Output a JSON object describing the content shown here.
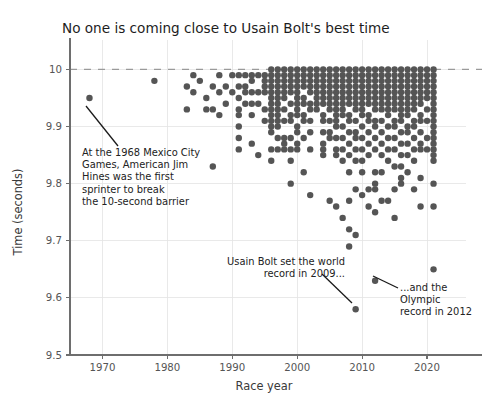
{
  "chart_data": {
    "type": "scatter",
    "title": "No one is coming close to Usain Bolt's best time",
    "xlabel": "Race year",
    "ylabel": "Time (seconds)",
    "xlim": [
      1965,
      2026
    ],
    "ylim": [
      9.5,
      10.02
    ],
    "xticks": [
      1970,
      1980,
      1990,
      2000,
      2010,
      2020
    ],
    "xtick_labels": [
      "1970",
      "1980",
      "1990",
      "2000",
      "2010",
      "2020"
    ],
    "yticks": [
      9.5,
      9.6,
      9.7,
      9.8,
      9.9,
      10.0
    ],
    "ytick_labels": [
      "9.5",
      "9.6",
      "9.7",
      "9.8",
      "9.9",
      "10"
    ],
    "grid": true,
    "legend": "none",
    "reference_line": {
      "y": 10.0,
      "style": "dashed",
      "label": "10-second barrier"
    },
    "marker": {
      "shape": "circle",
      "color": "#555555",
      "size": 4.6
    },
    "points": [
      [
        1968,
        9.95
      ],
      [
        1978,
        9.98
      ],
      [
        1983,
        9.93
      ],
      [
        1983,
        9.97
      ],
      [
        1984,
        9.96
      ],
      [
        1984,
        9.99
      ],
      [
        1985,
        9.98
      ],
      [
        1986,
        9.93
      ],
      [
        1986,
        9.95
      ],
      [
        1987,
        9.83
      ],
      [
        1987,
        9.93
      ],
      [
        1987,
        9.97
      ],
      [
        1988,
        9.92
      ],
      [
        1988,
        9.96
      ],
      [
        1988,
        9.99
      ],
      [
        1989,
        9.94
      ],
      [
        1989,
        9.97
      ],
      [
        1990,
        9.96
      ],
      [
        1990,
        9.99
      ],
      [
        1991,
        9.86
      ],
      [
        1991,
        9.88
      ],
      [
        1991,
        9.9
      ],
      [
        1991,
        9.92
      ],
      [
        1991,
        9.93
      ],
      [
        1991,
        9.95
      ],
      [
        1991,
        9.97
      ],
      [
        1991,
        9.99
      ],
      [
        1992,
        9.94
      ],
      [
        1992,
        9.96
      ],
      [
        1992,
        9.97
      ],
      [
        1992,
        9.99
      ],
      [
        1993,
        9.87
      ],
      [
        1993,
        9.92
      ],
      [
        1993,
        9.94
      ],
      [
        1993,
        9.96
      ],
      [
        1993,
        9.98
      ],
      [
        1993,
        9.99
      ],
      [
        1994,
        9.85
      ],
      [
        1994,
        9.94
      ],
      [
        1994,
        9.96
      ],
      [
        1994,
        9.99
      ],
      [
        1995,
        9.91
      ],
      [
        1995,
        9.93
      ],
      [
        1995,
        9.96
      ],
      [
        1995,
        9.97
      ],
      [
        1995,
        9.98
      ],
      [
        1995,
        9.99
      ],
      [
        1996,
        9.84
      ],
      [
        1996,
        9.86
      ],
      [
        1996,
        9.89
      ],
      [
        1996,
        9.9
      ],
      [
        1996,
        9.91
      ],
      [
        1996,
        9.92
      ],
      [
        1996,
        9.93
      ],
      [
        1996,
        9.94
      ],
      [
        1996,
        9.95
      ],
      [
        1996,
        9.96
      ],
      [
        1996,
        9.97
      ],
      [
        1996,
        9.98
      ],
      [
        1996,
        9.99
      ],
      [
        1996,
        10.0
      ],
      [
        1997,
        9.86
      ],
      [
        1997,
        9.88
      ],
      [
        1997,
        9.9
      ],
      [
        1997,
        9.91
      ],
      [
        1997,
        9.92
      ],
      [
        1997,
        9.93
      ],
      [
        1997,
        9.94
      ],
      [
        1997,
        9.95
      ],
      [
        1997,
        9.96
      ],
      [
        1997,
        9.97
      ],
      [
        1997,
        9.98
      ],
      [
        1997,
        9.99
      ],
      [
        1997,
        10.0
      ],
      [
        1998,
        9.86
      ],
      [
        1998,
        9.87
      ],
      [
        1998,
        9.88
      ],
      [
        1998,
        9.91
      ],
      [
        1998,
        9.93
      ],
      [
        1998,
        9.95
      ],
      [
        1998,
        9.96
      ],
      [
        1998,
        9.97
      ],
      [
        1998,
        9.98
      ],
      [
        1998,
        9.99
      ],
      [
        1998,
        10.0
      ],
      [
        1999,
        9.8
      ],
      [
        1999,
        9.84
      ],
      [
        1999,
        9.86
      ],
      [
        1999,
        9.88
      ],
      [
        1999,
        9.91
      ],
      [
        1999,
        9.92
      ],
      [
        1999,
        9.94
      ],
      [
        1999,
        9.96
      ],
      [
        1999,
        9.97
      ],
      [
        1999,
        9.98
      ],
      [
        1999,
        9.99
      ],
      [
        1999,
        10.0
      ],
      [
        2000,
        9.86
      ],
      [
        2000,
        9.87
      ],
      [
        2000,
        9.89
      ],
      [
        2000,
        9.9
      ],
      [
        2000,
        9.92
      ],
      [
        2000,
        9.93
      ],
      [
        2000,
        9.94
      ],
      [
        2000,
        9.95
      ],
      [
        2000,
        9.96
      ],
      [
        2000,
        9.97
      ],
      [
        2000,
        9.98
      ],
      [
        2000,
        9.99
      ],
      [
        2000,
        10.0
      ],
      [
        2001,
        9.82
      ],
      [
        2001,
        9.88
      ],
      [
        2001,
        9.91
      ],
      [
        2001,
        9.92
      ],
      [
        2001,
        9.94
      ],
      [
        2001,
        9.95
      ],
      [
        2001,
        9.97
      ],
      [
        2001,
        9.98
      ],
      [
        2001,
        9.99
      ],
      [
        2001,
        10.0
      ],
      [
        2002,
        9.78
      ],
      [
        2002,
        9.86
      ],
      [
        2002,
        9.89
      ],
      [
        2002,
        9.91
      ],
      [
        2002,
        9.93
      ],
      [
        2002,
        9.94
      ],
      [
        2002,
        9.96
      ],
      [
        2002,
        9.97
      ],
      [
        2002,
        9.98
      ],
      [
        2002,
        9.99
      ],
      [
        2002,
        10.0
      ],
      [
        2003,
        9.93
      ],
      [
        2003,
        9.94
      ],
      [
        2003,
        9.95
      ],
      [
        2003,
        9.96
      ],
      [
        2003,
        9.97
      ],
      [
        2003,
        9.98
      ],
      [
        2003,
        9.99
      ],
      [
        2003,
        10.0
      ],
      [
        2004,
        9.85
      ],
      [
        2004,
        9.86
      ],
      [
        2004,
        9.87
      ],
      [
        2004,
        9.89
      ],
      [
        2004,
        9.91
      ],
      [
        2004,
        9.92
      ],
      [
        2004,
        9.94
      ],
      [
        2004,
        9.95
      ],
      [
        2004,
        9.96
      ],
      [
        2004,
        9.97
      ],
      [
        2004,
        9.98
      ],
      [
        2004,
        9.99
      ],
      [
        2004,
        10.0
      ],
      [
        2005,
        9.77
      ],
      [
        2005,
        9.88
      ],
      [
        2005,
        9.89
      ],
      [
        2005,
        9.91
      ],
      [
        2005,
        9.93
      ],
      [
        2005,
        9.94
      ],
      [
        2005,
        9.95
      ],
      [
        2005,
        9.96
      ],
      [
        2005,
        9.97
      ],
      [
        2005,
        9.98
      ],
      [
        2005,
        9.99
      ],
      [
        2005,
        10.0
      ],
      [
        2006,
        9.76
      ],
      [
        2006,
        9.85
      ],
      [
        2006,
        9.86
      ],
      [
        2006,
        9.88
      ],
      [
        2006,
        9.9
      ],
      [
        2006,
        9.91
      ],
      [
        2006,
        9.92
      ],
      [
        2006,
        9.93
      ],
      [
        2006,
        9.94
      ],
      [
        2006,
        9.95
      ],
      [
        2006,
        9.96
      ],
      [
        2006,
        9.97
      ],
      [
        2006,
        9.98
      ],
      [
        2006,
        9.99
      ],
      [
        2006,
        10.0
      ],
      [
        2007,
        9.74
      ],
      [
        2007,
        9.84
      ],
      [
        2007,
        9.86
      ],
      [
        2007,
        9.88
      ],
      [
        2007,
        9.9
      ],
      [
        2007,
        9.92
      ],
      [
        2007,
        9.93
      ],
      [
        2007,
        9.94
      ],
      [
        2007,
        9.95
      ],
      [
        2007,
        9.96
      ],
      [
        2007,
        9.97
      ],
      [
        2007,
        9.98
      ],
      [
        2007,
        9.99
      ],
      [
        2007,
        10.0
      ],
      [
        2008,
        9.69
      ],
      [
        2008,
        9.72
      ],
      [
        2008,
        9.77
      ],
      [
        2008,
        9.82
      ],
      [
        2008,
        9.85
      ],
      [
        2008,
        9.87
      ],
      [
        2008,
        9.89
      ],
      [
        2008,
        9.91
      ],
      [
        2008,
        9.92
      ],
      [
        2008,
        9.94
      ],
      [
        2008,
        9.95
      ],
      [
        2008,
        9.96
      ],
      [
        2008,
        9.97
      ],
      [
        2008,
        9.98
      ],
      [
        2008,
        9.99
      ],
      [
        2008,
        10.0
      ],
      [
        2009,
        9.58
      ],
      [
        2009,
        9.71
      ],
      [
        2009,
        9.79
      ],
      [
        2009,
        9.84
      ],
      [
        2009,
        9.86
      ],
      [
        2009,
        9.88
      ],
      [
        2009,
        9.89
      ],
      [
        2009,
        9.91
      ],
      [
        2009,
        9.93
      ],
      [
        2009,
        9.94
      ],
      [
        2009,
        9.95
      ],
      [
        2009,
        9.96
      ],
      [
        2009,
        9.97
      ],
      [
        2009,
        9.98
      ],
      [
        2009,
        9.99
      ],
      [
        2009,
        10.0
      ],
      [
        2010,
        9.78
      ],
      [
        2010,
        9.82
      ],
      [
        2010,
        9.84
      ],
      [
        2010,
        9.86
      ],
      [
        2010,
        9.88
      ],
      [
        2010,
        9.9
      ],
      [
        2010,
        9.92
      ],
      [
        2010,
        9.93
      ],
      [
        2010,
        9.94
      ],
      [
        2010,
        9.95
      ],
      [
        2010,
        9.96
      ],
      [
        2010,
        9.97
      ],
      [
        2010,
        9.98
      ],
      [
        2010,
        9.99
      ],
      [
        2010,
        10.0
      ],
      [
        2011,
        9.76
      ],
      [
        2011,
        9.79
      ],
      [
        2011,
        9.85
      ],
      [
        2011,
        9.87
      ],
      [
        2011,
        9.89
      ],
      [
        2011,
        9.91
      ],
      [
        2011,
        9.92
      ],
      [
        2011,
        9.94
      ],
      [
        2011,
        9.95
      ],
      [
        2011,
        9.96
      ],
      [
        2011,
        9.97
      ],
      [
        2011,
        9.98
      ],
      [
        2011,
        9.99
      ],
      [
        2011,
        10.0
      ],
      [
        2012,
        9.63
      ],
      [
        2012,
        9.75
      ],
      [
        2012,
        9.79
      ],
      [
        2012,
        9.8
      ],
      [
        2012,
        9.82
      ],
      [
        2012,
        9.86
      ],
      [
        2012,
        9.88
      ],
      [
        2012,
        9.9
      ],
      [
        2012,
        9.91
      ],
      [
        2012,
        9.93
      ],
      [
        2012,
        9.94
      ],
      [
        2012,
        9.95
      ],
      [
        2012,
        9.96
      ],
      [
        2012,
        9.97
      ],
      [
        2012,
        9.98
      ],
      [
        2012,
        9.99
      ],
      [
        2012,
        10.0
      ],
      [
        2013,
        9.77
      ],
      [
        2013,
        9.82
      ],
      [
        2013,
        9.85
      ],
      [
        2013,
        9.87
      ],
      [
        2013,
        9.89
      ],
      [
        2013,
        9.91
      ],
      [
        2013,
        9.93
      ],
      [
        2013,
        9.94
      ],
      [
        2013,
        9.95
      ],
      [
        2013,
        9.96
      ],
      [
        2013,
        9.97
      ],
      [
        2013,
        9.98
      ],
      [
        2013,
        9.99
      ],
      [
        2013,
        10.0
      ],
      [
        2014,
        9.77
      ],
      [
        2014,
        9.84
      ],
      [
        2014,
        9.86
      ],
      [
        2014,
        9.88
      ],
      [
        2014,
        9.9
      ],
      [
        2014,
        9.92
      ],
      [
        2014,
        9.93
      ],
      [
        2014,
        9.94
      ],
      [
        2014,
        9.95
      ],
      [
        2014,
        9.96
      ],
      [
        2014,
        9.97
      ],
      [
        2014,
        9.98
      ],
      [
        2014,
        9.99
      ],
      [
        2014,
        10.0
      ],
      [
        2015,
        9.74
      ],
      [
        2015,
        9.79
      ],
      [
        2015,
        9.83
      ],
      [
        2015,
        9.86
      ],
      [
        2015,
        9.88
      ],
      [
        2015,
        9.9
      ],
      [
        2015,
        9.91
      ],
      [
        2015,
        9.93
      ],
      [
        2015,
        9.94
      ],
      [
        2015,
        9.95
      ],
      [
        2015,
        9.96
      ],
      [
        2015,
        9.97
      ],
      [
        2015,
        9.98
      ],
      [
        2015,
        9.99
      ],
      [
        2015,
        10.0
      ],
      [
        2016,
        9.8
      ],
      [
        2016,
        9.81
      ],
      [
        2016,
        9.83
      ],
      [
        2016,
        9.85
      ],
      [
        2016,
        9.87
      ],
      [
        2016,
        9.89
      ],
      [
        2016,
        9.91
      ],
      [
        2016,
        9.92
      ],
      [
        2016,
        9.93
      ],
      [
        2016,
        9.94
      ],
      [
        2016,
        9.95
      ],
      [
        2016,
        9.96
      ],
      [
        2016,
        9.97
      ],
      [
        2016,
        9.98
      ],
      [
        2016,
        9.99
      ],
      [
        2016,
        10.0
      ],
      [
        2017,
        9.82
      ],
      [
        2017,
        9.85
      ],
      [
        2017,
        9.87
      ],
      [
        2017,
        9.89
      ],
      [
        2017,
        9.9
      ],
      [
        2017,
        9.92
      ],
      [
        2017,
        9.93
      ],
      [
        2017,
        9.94
      ],
      [
        2017,
        9.95
      ],
      [
        2017,
        9.96
      ],
      [
        2017,
        9.97
      ],
      [
        2017,
        9.98
      ],
      [
        2017,
        9.99
      ],
      [
        2017,
        10.0
      ],
      [
        2018,
        9.79
      ],
      [
        2018,
        9.84
      ],
      [
        2018,
        9.86
      ],
      [
        2018,
        9.88
      ],
      [
        2018,
        9.9
      ],
      [
        2018,
        9.91
      ],
      [
        2018,
        9.93
      ],
      [
        2018,
        9.94
      ],
      [
        2018,
        9.95
      ],
      [
        2018,
        9.96
      ],
      [
        2018,
        9.97
      ],
      [
        2018,
        9.98
      ],
      [
        2018,
        9.99
      ],
      [
        2018,
        10.0
      ],
      [
        2019,
        9.76
      ],
      [
        2019,
        9.81
      ],
      [
        2019,
        9.86
      ],
      [
        2019,
        9.87
      ],
      [
        2019,
        9.89
      ],
      [
        2019,
        9.91
      ],
      [
        2019,
        9.92
      ],
      [
        2019,
        9.94
      ],
      [
        2019,
        9.95
      ],
      [
        2019,
        9.96
      ],
      [
        2019,
        9.97
      ],
      [
        2019,
        9.98
      ],
      [
        2019,
        9.99
      ],
      [
        2019,
        10.0
      ],
      [
        2020,
        9.86
      ],
      [
        2020,
        9.88
      ],
      [
        2020,
        9.91
      ],
      [
        2020,
        9.93
      ],
      [
        2020,
        9.95
      ],
      [
        2020,
        9.96
      ],
      [
        2020,
        9.97
      ],
      [
        2020,
        9.98
      ],
      [
        2020,
        9.99
      ],
      [
        2020,
        10.0
      ],
      [
        2021,
        9.65
      ],
      [
        2021,
        9.76
      ],
      [
        2021,
        9.8
      ],
      [
        2021,
        9.84
      ],
      [
        2021,
        9.85
      ],
      [
        2021,
        9.86
      ],
      [
        2021,
        9.87
      ],
      [
        2021,
        9.88
      ],
      [
        2021,
        9.89
      ],
      [
        2021,
        9.9
      ],
      [
        2021,
        9.91
      ],
      [
        2021,
        9.92
      ],
      [
        2021,
        9.93
      ],
      [
        2021,
        9.94
      ],
      [
        2021,
        9.95
      ],
      [
        2021,
        9.96
      ],
      [
        2021,
        9.97
      ],
      [
        2021,
        9.98
      ],
      [
        2021,
        9.99
      ],
      [
        2021,
        10.0
      ]
    ],
    "annotations": [
      {
        "id": "hines-annotation",
        "lines": [
          "At the 1968 Mexico City",
          "Games, American Jim",
          "Hines was the first",
          "sprinter to break",
          "the 10-second barrier"
        ],
        "align": "left",
        "target": [
          1968,
          9.95
        ]
      },
      {
        "id": "bolt-world-record-annotation",
        "lines": [
          "Usain Bolt set the world",
          "record in 2009..."
        ],
        "align": "right",
        "target": [
          2009,
          9.58
        ]
      },
      {
        "id": "olympic-record-annotation",
        "lines": [
          "...and the",
          "Olympic",
          "record in 2012"
        ],
        "align": "left",
        "target": [
          2012,
          9.63
        ]
      }
    ]
  }
}
